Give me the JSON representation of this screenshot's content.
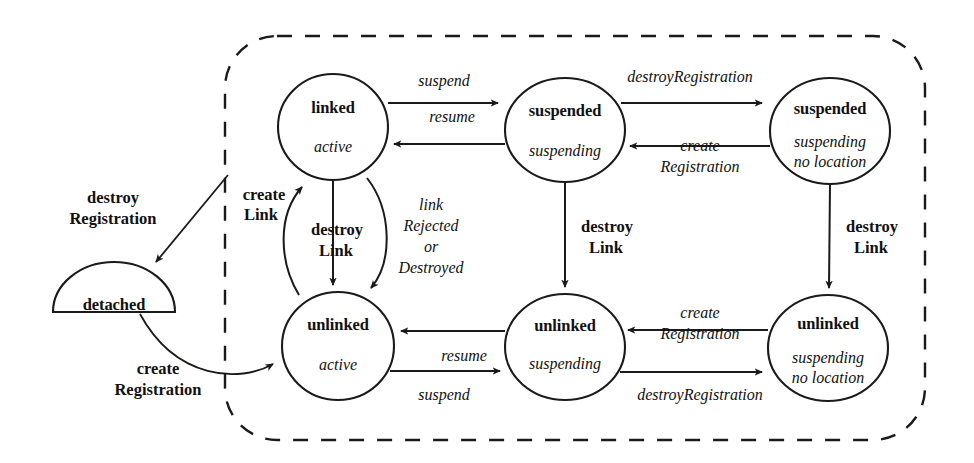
{
  "diagram": {
    "type": "state-diagram",
    "canvas": {
      "width": 974,
      "height": 463
    },
    "colors": {
      "stroke": "#1a1a1a",
      "fill": "#ffffff",
      "text": "#111111"
    },
    "region": {
      "name": "attached-region",
      "style": "dashed-rounded-rectangle",
      "x": 225,
      "y": 36,
      "width": 700,
      "height": 404,
      "radius": 52
    },
    "states": [
      {
        "id": "detached",
        "shape": "half-circle",
        "name": "detached",
        "sub": "",
        "cx": 114,
        "cy": 312,
        "rx": 61,
        "ry": 50
      },
      {
        "id": "linked-active",
        "shape": "circle",
        "name": "linked",
        "sub": "active",
        "sub2": "",
        "cx": 333,
        "cy": 127,
        "rx": 55,
        "ry": 53
      },
      {
        "id": "suspended-suspending",
        "shape": "circle",
        "name": "suspended",
        "sub": "suspending",
        "sub2": "",
        "cx": 565,
        "cy": 130,
        "rx": 60,
        "ry": 52
      },
      {
        "id": "suspended-suspending-no-location",
        "shape": "circle",
        "name": "suspended",
        "sub": "suspending",
        "sub2": "no location",
        "cx": 830,
        "cy": 131,
        "rx": 60,
        "ry": 53
      },
      {
        "id": "unlinked-active",
        "shape": "circle",
        "name": "unlinked",
        "sub": "active",
        "sub2": "",
        "cx": 338,
        "cy": 346,
        "rx": 56,
        "ry": 54
      },
      {
        "id": "unlinked-suspending",
        "shape": "circle",
        "name": "unlinked",
        "sub": "suspending",
        "sub2": "",
        "cx": 565,
        "cy": 347,
        "rx": 60,
        "ry": 53
      },
      {
        "id": "unlinked-suspending-no-location",
        "shape": "circle",
        "name": "unlinked",
        "sub": "suspending",
        "sub2": "no location",
        "cx": 828,
        "cy": 348,
        "rx": 60,
        "ry": 53
      }
    ],
    "transitions": [
      {
        "id": "t1",
        "from": "linked-active",
        "to": "suspended-suspending",
        "label": "suspend",
        "style": "italic"
      },
      {
        "id": "t2",
        "from": "suspended-suspending",
        "to": "linked-active",
        "label": "resume",
        "style": "italic"
      },
      {
        "id": "t3",
        "from": "suspended-suspending",
        "to": "suspended-suspending-no-location",
        "label": "destroyRegistration",
        "style": "italic"
      },
      {
        "id": "t4",
        "from": "suspended-suspending-no-location",
        "to": "suspended-suspending",
        "label": "create Registration",
        "line1": "create",
        "line2": "Registration",
        "style": "italic"
      },
      {
        "id": "t5",
        "from": "unlinked-suspending",
        "to": "unlinked-active",
        "label": "resume",
        "style": "italic"
      },
      {
        "id": "t6",
        "from": "unlinked-active",
        "to": "unlinked-suspending",
        "label": "suspend",
        "style": "italic"
      },
      {
        "id": "t7",
        "from": "unlinked-suspending",
        "to": "unlinked-suspending-no-location",
        "label": "destroyRegistration",
        "style": "italic"
      },
      {
        "id": "t8",
        "from": "unlinked-suspending-no-location",
        "to": "unlinked-suspending",
        "label": "create Registration",
        "line1": "create",
        "line2": "Registration",
        "style": "italic"
      },
      {
        "id": "t9",
        "from": "suspended-suspending",
        "to": "unlinked-suspending",
        "label": "destroy Link",
        "line1": "destroy",
        "line2": "Link",
        "style": "bold"
      },
      {
        "id": "t10",
        "from": "suspended-suspending-no-location",
        "to": "unlinked-suspending-no-location",
        "label": "destroy Link",
        "line1": "destroy",
        "line2": "Link",
        "style": "bold"
      },
      {
        "id": "t11",
        "from": "linked-active",
        "to": "unlinked-active",
        "label": "destroy Link",
        "line1": "destroy",
        "line2": "Link",
        "style": "bold"
      },
      {
        "id": "t12",
        "from": "unlinked-active",
        "to": "linked-active",
        "label": "create Link",
        "line1": "create",
        "line2": "Link",
        "style": "bold"
      },
      {
        "id": "t13",
        "from": "linked-active",
        "to": "unlinked-active",
        "label": "link Rejected or Destroyed",
        "line1": "link",
        "line2": "Rejected",
        "line3": "or",
        "line4": "Destroyed",
        "style": "italic"
      },
      {
        "id": "t14",
        "from": "attached-region",
        "to": "detached",
        "label": "destroy Registration",
        "line1": "destroy",
        "line2": "Registration",
        "style": "bold"
      },
      {
        "id": "t15",
        "from": "detached",
        "to": "unlinked-active",
        "label": "create Registration",
        "line1": "create",
        "line2": "Registration",
        "style": "bold"
      }
    ],
    "labels": {
      "suspend_top": "suspend",
      "resume_top": "resume",
      "destroyRegistration_top": "destroyRegistration",
      "create_top": "create",
      "Registration_top": "Registration",
      "destroy_mid_left": "destroy",
      "Link_mid_left": "Link",
      "create_mid_left": "create",
      "Link_create_left": "Link",
      "link": "link",
      "Rejected": "Rejected",
      "or": "or",
      "Destroyed": "Destroyed",
      "destroy_col2": "destroy",
      "Link_col2": "Link",
      "destroy_col3": "destroy",
      "Link_col3": "Link",
      "resume_bottom": "resume",
      "suspend_bottom": "suspend",
      "create_bottom": "create",
      "Registration_bottom": "Registration",
      "destroyRegistration_bottom": "destroyRegistration",
      "destroy_detach": "destroy",
      "Registration_detach": "Registration",
      "create_detach": "create",
      "Registration_create_detach": "Registration"
    },
    "state_text": {
      "detached_name": "detached",
      "linked_name": "linked",
      "linked_sub": "active",
      "suspended1_name": "suspended",
      "suspended1_sub": "suspending",
      "suspended2_name": "suspended",
      "suspended2_sub": "suspending",
      "suspended2_sub2": "no location",
      "unlinked1_name": "unlinked",
      "unlinked1_sub": "active",
      "unlinked2_name": "unlinked",
      "unlinked2_sub": "suspending",
      "unlinked3_name": "unlinked",
      "unlinked3_sub": "suspending",
      "unlinked3_sub2": "no location"
    }
  }
}
